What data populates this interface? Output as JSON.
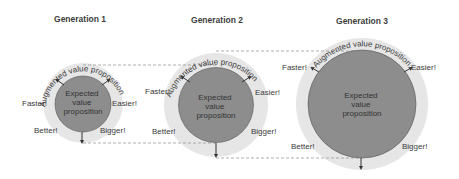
{
  "diagram": {
    "generations": [
      {
        "title": "Generation 1",
        "augmented_label": "Augmented value proposition",
        "core_lines": [
          "Expected",
          "value",
          "proposition"
        ],
        "labels": {
          "top_left": "Faster!",
          "top_right": "Easier!",
          "bottom_left": "Better!",
          "bottom_right": "Bigger!"
        }
      },
      {
        "title": "Generation 2",
        "augmented_label": "Augmented value proposition",
        "core_lines": [
          "Expected",
          "value",
          "proposition"
        ],
        "labels": {
          "top_left": "Faster!",
          "top_right": "Easier!",
          "bottom_left": "Better!",
          "bottom_right": "Bigger!"
        }
      },
      {
        "title": "Generation 3",
        "augmented_label": "Augmented value proposition",
        "core_lines": [
          "Expected",
          "value",
          "proposition"
        ],
        "labels": {
          "top_left": "Faster!",
          "top_right": "Easier!",
          "bottom_left": "Better!",
          "bottom_right": "Bigger!"
        }
      }
    ],
    "colors": {
      "core_fill": "#8d8d8d",
      "augmented_fill": "#e6e6e6",
      "text": "#3a3a3a",
      "dash": "#9a9a9a"
    }
  }
}
